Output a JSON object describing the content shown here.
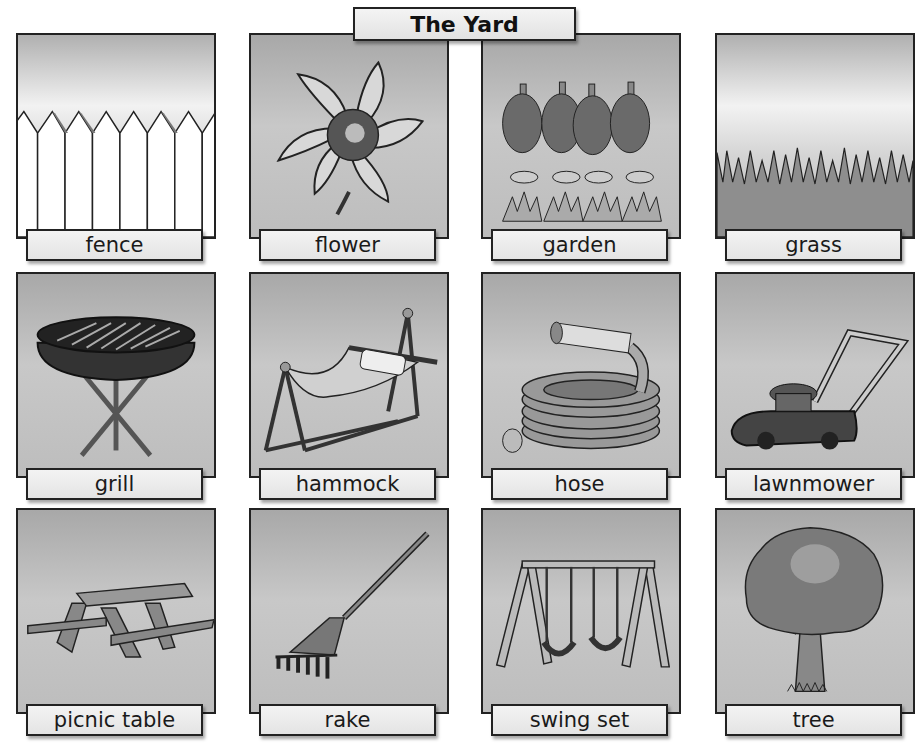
{
  "title": "The Yard",
  "cards": [
    {
      "label": "fence",
      "icon": "fence-icon"
    },
    {
      "label": "flower",
      "icon": "flower-icon"
    },
    {
      "label": "garden",
      "icon": "garden-icon"
    },
    {
      "label": "grass",
      "icon": "grass-icon"
    },
    {
      "label": "grill",
      "icon": "grill-icon"
    },
    {
      "label": "hammock",
      "icon": "hammock-icon"
    },
    {
      "label": "hose",
      "icon": "hose-icon"
    },
    {
      "label": "lawnmower",
      "icon": "lawnmower-icon"
    },
    {
      "label": "picnic table",
      "icon": "picnic-table-icon"
    },
    {
      "label": "rake",
      "icon": "rake-icon"
    },
    {
      "label": "swing set",
      "icon": "swing-set-icon"
    },
    {
      "label": "tree",
      "icon": "tree-icon"
    }
  ],
  "colors": {
    "border": "#222222",
    "label_bg": "#eeeeee",
    "panel_bg": "#bcbcbc"
  }
}
